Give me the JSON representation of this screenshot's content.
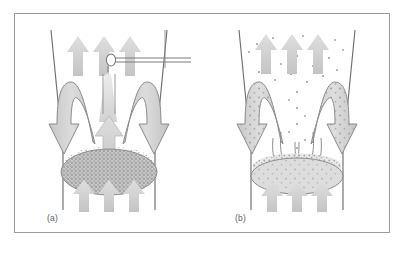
{
  "figure": {
    "background_color": "#ffffff",
    "frame_color": "#9b9b9b",
    "panels": [
      {
        "id": "a",
        "caption": "(a)",
        "regime_name": "bubbling-dense-bed",
        "has_probe": true,
        "dense_zone_style": "stippled-dark",
        "freeboard_style": "clear",
        "outlet_arrow_count": 3,
        "inlet_arrow_count": 3,
        "recirculation_loop_count": 2,
        "central_jet_arrows": 2
      },
      {
        "id": "b",
        "caption": "(b)",
        "regime_name": "turbulent-dispersed-bed",
        "has_probe": false,
        "dense_zone_style": "light-dotted",
        "freeboard_style": "scattered-particles",
        "outlet_arrow_count": 3,
        "inlet_arrow_count": 3,
        "recirculation_loop_count": 2,
        "inner_loop_count": 2
      }
    ],
    "colors": {
      "vessel_wall": "#6f6f6f",
      "arrow_fill_light": "#d5d5d5",
      "arrow_outline": "#8a8a8a",
      "loop_fill": "#cfcfcf",
      "dense_bed_fill": "#b6b6b6",
      "dense_bed_light": "#d8d8d8",
      "particle_dot": "#a2a2a2",
      "probe_line": "#7a7a7a",
      "caption_text": "#5e5e5e"
    }
  }
}
